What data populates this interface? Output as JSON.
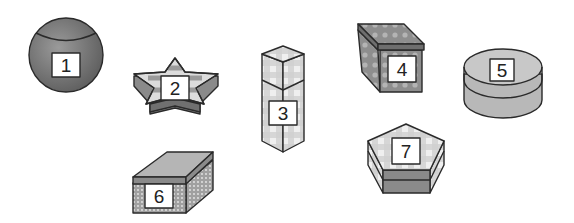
{
  "figure": {
    "items": [
      {
        "number": "1",
        "shape": "sphere",
        "pattern": "solid"
      },
      {
        "number": "2",
        "shape": "star prism",
        "pattern": "stripes"
      },
      {
        "number": "3",
        "shape": "tall square prism",
        "pattern": "gingham"
      },
      {
        "number": "4",
        "shape": "cube",
        "pattern": "polka dots"
      },
      {
        "number": "5",
        "shape": "cylinder",
        "pattern": "solid"
      },
      {
        "number": "6",
        "shape": "rectangular box",
        "pattern": "dotted border"
      },
      {
        "number": "7",
        "shape": "pentagonal prism",
        "pattern": "gingham"
      }
    ]
  },
  "colors": {
    "dark_fill": "#7a7a7a",
    "mid_fill": "#a8a8a8",
    "light_fill": "#cfcfcf",
    "outline": "#2a2a2a",
    "label_bg": "#ffffff"
  }
}
